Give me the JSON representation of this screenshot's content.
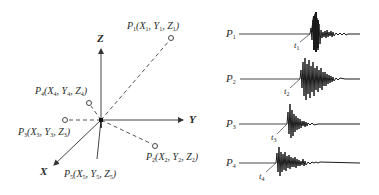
{
  "figure": {
    "left_panel": {
      "title": "3D sensor layout",
      "axes": [
        {
          "id": "Z",
          "label": "Z"
        },
        {
          "id": "Y",
          "label": "Y"
        },
        {
          "id": "X",
          "label": "X"
        }
      ],
      "points": [
        {
          "id": "P1",
          "name": "P",
          "index": "1",
          "coords": [
            "X",
            "1",
            "Y",
            "1",
            "Z",
            "1"
          ]
        },
        {
          "id": "P2",
          "name": "P",
          "index": "2",
          "coords": [
            "X",
            "2",
            "Y",
            "2",
            "Z",
            "2"
          ]
        },
        {
          "id": "P3",
          "name": "P",
          "index": "3",
          "coords": [
            "X",
            "3",
            "Y",
            "3",
            "Z",
            "3"
          ]
        },
        {
          "id": "P4",
          "name": "P",
          "index": "4",
          "coords": [
            "X",
            "4",
            "Y",
            "4",
            "Z",
            "4"
          ]
        },
        {
          "id": "P5",
          "name": "P",
          "index": "5",
          "coords": [
            "X",
            "5",
            "Y",
            "5",
            "Z",
            "5"
          ]
        }
      ]
    },
    "right_panel": {
      "title": "Received waveforms",
      "traces": [
        {
          "sensor": "P",
          "sensor_index": "1",
          "arrival": "t",
          "arrival_index": "1"
        },
        {
          "sensor": "P",
          "sensor_index": "2",
          "arrival": "t",
          "arrival_index": "2"
        },
        {
          "sensor": "P",
          "sensor_index": "3",
          "arrival": "t",
          "arrival_index": "3"
        },
        {
          "sensor": "P",
          "sensor_index": "4",
          "arrival": "t",
          "arrival_index": "4"
        }
      ]
    },
    "colors": {
      "line": "#333333",
      "dashed": "#555555",
      "waveform": "#1a1a1a",
      "background": "#ffffff"
    }
  }
}
